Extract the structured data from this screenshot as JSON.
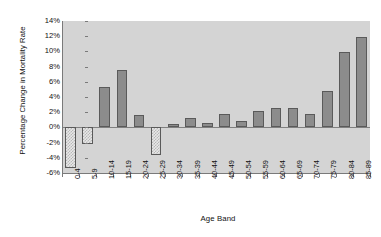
{
  "chart_data": {
    "type": "bar",
    "title": "",
    "subtitle": "",
    "xlabel": "Age Band",
    "ylabel": "Percentage Change in Mortality Rate",
    "ylim": [
      -6,
      14
    ],
    "ytick_step": 2,
    "grid": "horizontal-bands",
    "legend": "none",
    "value_suffix": "%",
    "categories": [
      "0-4",
      "5-9",
      "10-14",
      "15-19",
      "20-24",
      "25-29",
      "30-34",
      "35-39",
      "40-44",
      "45-49",
      "50-54",
      "55-59",
      "60-64",
      "65-69",
      "70-74",
      "75-79",
      "80-84",
      "85-89"
    ],
    "values": [
      -5.3,
      -2.2,
      5.3,
      7.5,
      1.6,
      -3.6,
      0.4,
      1.3,
      0.6,
      1.8,
      0.8,
      2.1,
      2.6,
      2.6,
      1.8,
      4.8,
      9.9,
      11.9
    ],
    "ytick_labels": [
      "14%",
      "12%",
      "10%",
      "8%",
      "6%",
      "4%",
      "2%",
      "0%",
      "-2%",
      "-4%",
      "-6%"
    ],
    "ytick_values": [
      14,
      12,
      10,
      8,
      6,
      4,
      2,
      0,
      -2,
      -4,
      -6
    ],
    "colors": {
      "positive_bar": "#8c8c8c",
      "negative_bar": "#e8e8e8",
      "bar_border": "#5a5a5a",
      "band": "#d4d4d4",
      "plot_background": "#ffffff",
      "axis": "#7a7a7a",
      "text": "#111111"
    }
  }
}
